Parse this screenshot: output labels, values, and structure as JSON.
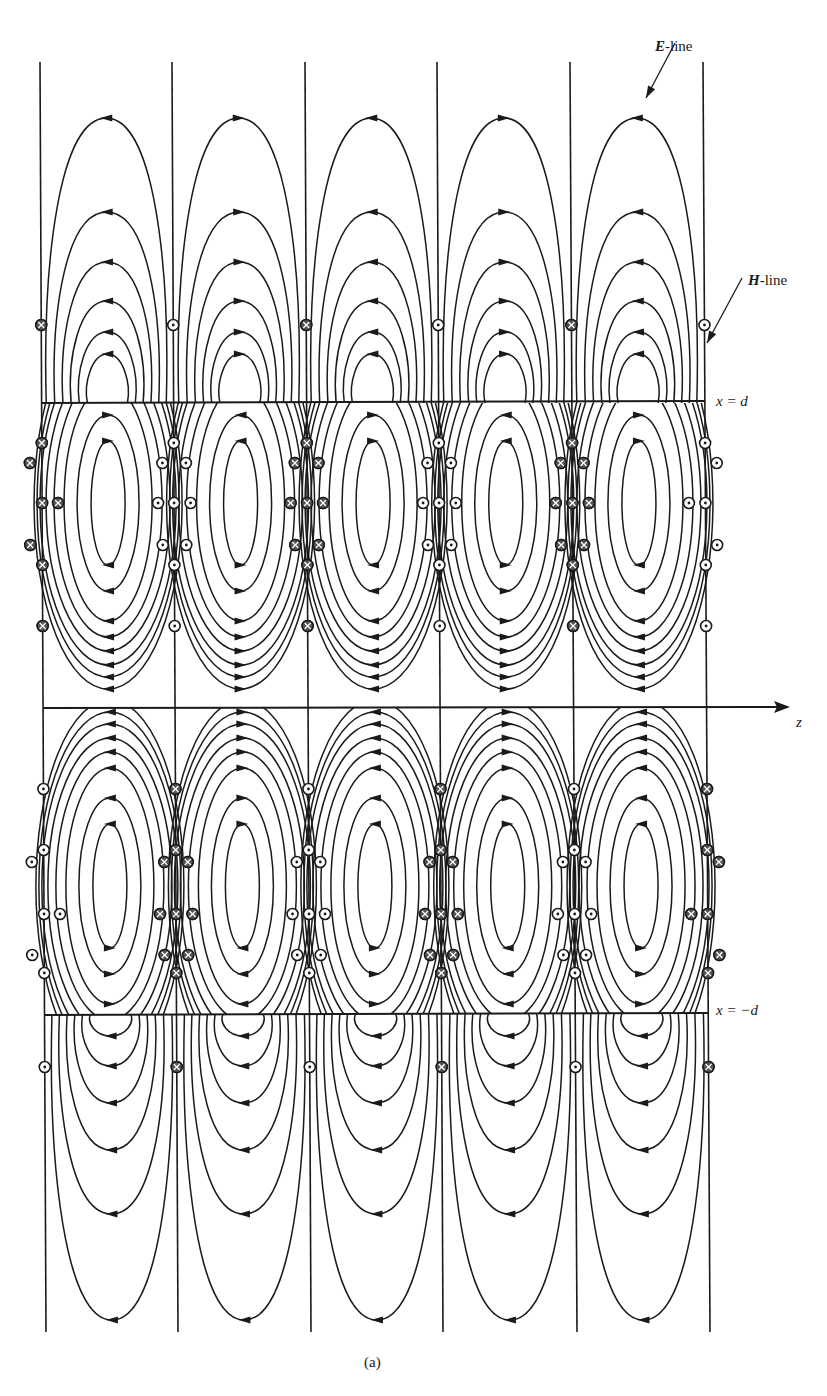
{
  "figure": {
    "caption": "(a)",
    "colors": {
      "line": "#1a1a1a",
      "background": "#ffffff"
    },
    "labels": {
      "e_line": {
        "bold": "E",
        "rest": "-line"
      },
      "h_line": {
        "bold": "H",
        "rest": "-line"
      },
      "upper_boundary": "x = d",
      "lower_boundary": "x = −d",
      "axis": "z"
    },
    "geometry": {
      "columns_top_x": [
        40,
        172,
        305,
        437,
        570,
        703
      ],
      "columns_bottom_x": [
        46,
        178,
        311,
        443,
        577,
        710
      ],
      "column_top_y": 62,
      "column_bottom_y": 1332,
      "upper_boundary_y": 403,
      "axis_y": 708,
      "lower_boundary_y": 1014,
      "axis_x_end": 790,
      "upper_loop_center_y": 503,
      "lower_loop_center_y": 886
    },
    "outer_e_lines": {
      "upper_apex_y": [
        118,
        212,
        262,
        301,
        332,
        354
      ],
      "lower_apex_y": [
        1320,
        1214,
        1150,
        1103,
        1066,
        1036
      ]
    },
    "inner_loops": {
      "half_widths": [
        17,
        31,
        44,
        54,
        62,
        68
      ],
      "half_heights": [
        62,
        88,
        118,
        134,
        148,
        162,
        174,
        186
      ]
    },
    "h_markers": {
      "upper_column_pattern": [
        "cross",
        "dot",
        "cross",
        "dot",
        "cross",
        "dot"
      ],
      "lower_column_pattern": [
        "dot",
        "cross",
        "dot",
        "cross",
        "dot",
        "cross"
      ],
      "upper_column_y": [
        325,
        443,
        503,
        565,
        626
      ],
      "lower_column_y": [
        789,
        850,
        914,
        973,
        1067
      ],
      "upper_cell_y": [
        463,
        503,
        545
      ],
      "lower_cell_y": [
        862,
        914,
        955
      ],
      "legend": {
        "dot": "⊙ out of page",
        "cross": "⊗ into page"
      }
    }
  }
}
